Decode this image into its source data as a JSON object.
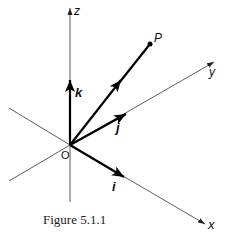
{
  "figure": {
    "caption": "Figure 5.1.1",
    "origin_label": "O",
    "point_label": "P",
    "axes": {
      "x_label": "x",
      "y_label": "y",
      "z_label": "z"
    },
    "unit_vectors": {
      "i_label": "i",
      "j_label": "j",
      "k_label": "k"
    }
  }
}
